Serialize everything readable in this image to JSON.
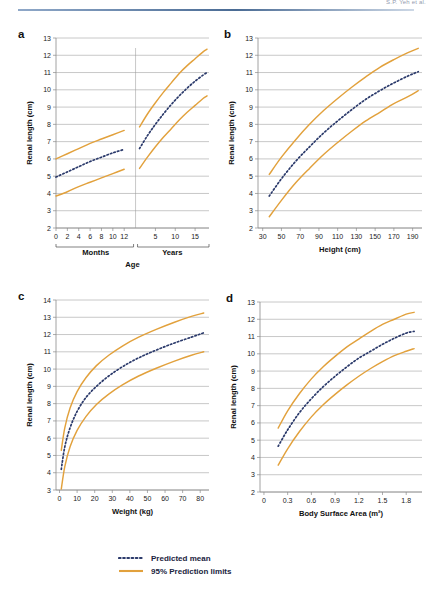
{
  "header": {
    "running_text": "S.P. Yeh et al."
  },
  "colors": {
    "mean": "#2B3A6B",
    "limits": "#E2A13C",
    "grid": "#9b9b9b",
    "axis": "#8a8a8a"
  },
  "legend": {
    "items": [
      {
        "label": "Predicted mean",
        "style": "dotted",
        "color": "#2B3A6B"
      },
      {
        "label": "95% Prediction limits",
        "style": "solid",
        "color": "#E2A13C"
      }
    ]
  },
  "chart_data": [
    {
      "id": "a",
      "panel_letter": "a",
      "type": "line",
      "title": "",
      "xlabel": "Age",
      "ylabel": "Renal length (cm)",
      "grid": true,
      "legend_position": "figure-bottom",
      "ylim": [
        2,
        13
      ],
      "yticks": [
        2,
        3,
        4,
        5,
        6,
        7,
        8,
        9,
        10,
        11,
        12,
        13
      ],
      "axis_segments": [
        {
          "label": "Months",
          "ticks": [
            0,
            2,
            4,
            6,
            8,
            10,
            12
          ]
        },
        {
          "label": "Years",
          "ticks": [
            5,
            10,
            15
          ]
        }
      ],
      "segment_note": "x-axis is split: months 0-12 then years up to ~18",
      "series": [
        {
          "name": "95% upper prediction limit",
          "style": "solid",
          "color": "#E2A13C",
          "segment": "months",
          "x": [
            0,
            2,
            4,
            6,
            8,
            10,
            12
          ],
          "values": [
            6.0,
            6.3,
            6.6,
            6.9,
            7.15,
            7.4,
            7.65
          ]
        },
        {
          "name": "Predicted mean",
          "style": "dotted",
          "color": "#2B3A6B",
          "segment": "months",
          "x": [
            0,
            2,
            4,
            6,
            8,
            10,
            12
          ],
          "values": [
            4.95,
            5.25,
            5.55,
            5.85,
            6.1,
            6.35,
            6.55
          ]
        },
        {
          "name": "95% lower prediction limit",
          "style": "solid",
          "color": "#E2A13C",
          "segment": "months",
          "x": [
            0,
            2,
            4,
            6,
            8,
            10,
            12
          ],
          "values": [
            3.85,
            4.1,
            4.4,
            4.65,
            4.9,
            5.15,
            5.4
          ]
        },
        {
          "name": "95% upper prediction limit",
          "style": "solid",
          "color": "#E2A13C",
          "segment": "years",
          "x": [
            1,
            3,
            5,
            7,
            9,
            11,
            13,
            15,
            17,
            18
          ],
          "values": [
            7.85,
            8.6,
            9.25,
            9.85,
            10.4,
            10.95,
            11.4,
            11.8,
            12.2,
            12.35
          ]
        },
        {
          "name": "Predicted mean",
          "style": "dotted",
          "color": "#2B3A6B",
          "segment": "years",
          "x": [
            1,
            3,
            5,
            7,
            9,
            11,
            13,
            15,
            17,
            18
          ],
          "values": [
            6.6,
            7.35,
            8.0,
            8.6,
            9.15,
            9.65,
            10.1,
            10.5,
            10.85,
            11.0
          ]
        },
        {
          "name": "95% lower prediction limit",
          "style": "solid",
          "color": "#E2A13C",
          "segment": "years",
          "x": [
            1,
            3,
            5,
            7,
            9,
            11,
            13,
            15,
            17,
            18
          ],
          "values": [
            5.45,
            6.1,
            6.7,
            7.25,
            7.75,
            8.25,
            8.7,
            9.1,
            9.5,
            9.65
          ]
        }
      ]
    },
    {
      "id": "b",
      "panel_letter": "b",
      "type": "line",
      "title": "",
      "xlabel": "Height (cm)",
      "ylabel": "Renal length (cm)",
      "grid": true,
      "xlim": [
        25,
        200
      ],
      "ylim": [
        2,
        13
      ],
      "xticks": [
        30,
        50,
        70,
        90,
        110,
        130,
        150,
        170,
        190
      ],
      "yticks": [
        2,
        3,
        4,
        5,
        6,
        7,
        8,
        9,
        10,
        11,
        12,
        13
      ],
      "series": [
        {
          "name": "95% upper prediction limit",
          "style": "solid",
          "color": "#E2A13C",
          "x": [
            37,
            50,
            65,
            80,
            95,
            110,
            125,
            140,
            155,
            170,
            185,
            196
          ],
          "values": [
            5.1,
            6.1,
            7.1,
            8.0,
            8.8,
            9.5,
            10.15,
            10.75,
            11.3,
            11.75,
            12.15,
            12.4
          ]
        },
        {
          "name": "Predicted mean",
          "style": "dotted",
          "color": "#2B3A6B",
          "x": [
            37,
            50,
            65,
            80,
            95,
            110,
            125,
            140,
            155,
            170,
            185,
            196
          ],
          "values": [
            3.85,
            4.85,
            5.85,
            6.7,
            7.5,
            8.2,
            8.85,
            9.45,
            9.95,
            10.4,
            10.8,
            11.05
          ]
        },
        {
          "name": "95% lower prediction limit",
          "style": "solid",
          "color": "#E2A13C",
          "x": [
            37,
            50,
            65,
            80,
            95,
            110,
            125,
            140,
            155,
            170,
            185,
            196
          ],
          "values": [
            2.65,
            3.6,
            4.6,
            5.45,
            6.25,
            6.95,
            7.6,
            8.2,
            8.7,
            9.2,
            9.6,
            9.95
          ]
        }
      ]
    },
    {
      "id": "c",
      "panel_letter": "c",
      "type": "line",
      "title": "",
      "xlabel": "Weight (kg)",
      "ylabel": "Renal length (cm)",
      "grid": true,
      "xlim": [
        -2,
        85
      ],
      "ylim": [
        3,
        14
      ],
      "xticks": [
        0,
        10,
        20,
        30,
        40,
        50,
        60,
        70,
        80
      ],
      "yticks": [
        3,
        4,
        5,
        6,
        7,
        8,
        9,
        10,
        11,
        12,
        13,
        14
      ],
      "series": [
        {
          "name": "95% upper prediction limit",
          "style": "solid",
          "color": "#E2A13C",
          "x": [
            1,
            3,
            6,
            10,
            15,
            21,
            28,
            36,
            45,
            55,
            65,
            75,
            82
          ],
          "values": [
            5.3,
            6.6,
            7.75,
            8.7,
            9.5,
            10.2,
            10.8,
            11.35,
            11.85,
            12.3,
            12.7,
            13.05,
            13.25
          ]
        },
        {
          "name": "Predicted mean",
          "style": "dotted",
          "color": "#2B3A6B",
          "x": [
            1,
            3,
            6,
            10,
            15,
            21,
            28,
            36,
            45,
            55,
            65,
            75,
            82
          ],
          "values": [
            4.2,
            5.5,
            6.6,
            7.55,
            8.35,
            9.0,
            9.6,
            10.15,
            10.65,
            11.1,
            11.5,
            11.85,
            12.1
          ]
        },
        {
          "name": "95% lower prediction limit",
          "style": "solid",
          "color": "#E2A13C",
          "x": [
            1,
            3,
            6,
            10,
            15,
            21,
            28,
            36,
            45,
            55,
            65,
            75,
            82
          ],
          "values": [
            3.05,
            4.35,
            5.5,
            6.45,
            7.25,
            7.95,
            8.55,
            9.1,
            9.6,
            10.05,
            10.45,
            10.8,
            11.0
          ]
        }
      ]
    },
    {
      "id": "d",
      "panel_letter": "d",
      "type": "line",
      "title": "",
      "xlabel": "Body Surface Area (m²)",
      "ylabel": "Renal length (cm)",
      "grid": true,
      "xlim": [
        -0.05,
        2.0
      ],
      "ylim": [
        2,
        13
      ],
      "xticks": [
        0,
        0.3,
        0.6,
        0.9,
        1.2,
        1.5,
        1.8
      ],
      "yticks": [
        2,
        3,
        4,
        5,
        6,
        7,
        8,
        9,
        10,
        11,
        12,
        13
      ],
      "series": [
        {
          "name": "95% upper prediction limit",
          "style": "solid",
          "color": "#E2A13C",
          "x": [
            0.18,
            0.3,
            0.45,
            0.6,
            0.75,
            0.9,
            1.05,
            1.2,
            1.35,
            1.5,
            1.65,
            1.8,
            1.9
          ],
          "values": [
            5.7,
            6.7,
            7.7,
            8.55,
            9.25,
            9.85,
            10.4,
            10.85,
            11.3,
            11.7,
            12.0,
            12.3,
            12.4
          ]
        },
        {
          "name": "Predicted mean",
          "style": "dotted",
          "color": "#2B3A6B",
          "x": [
            0.18,
            0.3,
            0.45,
            0.6,
            0.75,
            0.9,
            1.05,
            1.2,
            1.35,
            1.5,
            1.65,
            1.8,
            1.9
          ],
          "values": [
            4.65,
            5.6,
            6.6,
            7.4,
            8.1,
            8.7,
            9.25,
            9.75,
            10.15,
            10.55,
            10.9,
            11.2,
            11.3
          ]
        },
        {
          "name": "95% lower prediction limit",
          "style": "solid",
          "color": "#E2A13C",
          "x": [
            0.18,
            0.3,
            0.45,
            0.6,
            0.75,
            0.9,
            1.05,
            1.2,
            1.35,
            1.5,
            1.65,
            1.8,
            1.9
          ],
          "values": [
            3.55,
            4.5,
            5.5,
            6.35,
            7.05,
            7.65,
            8.2,
            8.7,
            9.15,
            9.55,
            9.9,
            10.15,
            10.3
          ]
        }
      ]
    }
  ]
}
